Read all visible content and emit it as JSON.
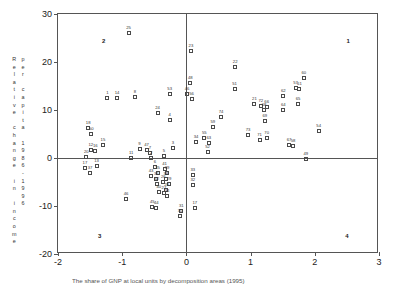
{
  "chart_data": {
    "type": "scatter",
    "title": "",
    "xlabel": "",
    "ylabel": "Relative change in income per capita 1986-1996",
    "ylabel_col1": "Relative change in income",
    "ylabel_col2": "per capita 1986-1996",
    "xlim": [
      -2,
      3
    ],
    "ylim": [
      -20,
      30
    ],
    "xticks": [
      -2,
      -1,
      0,
      1,
      2,
      3
    ],
    "xticklabels": [
      "-2",
      "-1",
      "0",
      "1",
      "2",
      "3"
    ],
    "yticks": [
      -20,
      -10,
      0,
      10,
      20,
      30
    ],
    "yticklabels": [
      "-20",
      "-10",
      "0",
      "10",
      "20",
      "30"
    ],
    "grid": false,
    "legend": null,
    "marker": "open-square",
    "quadrant_labels": [
      {
        "label": "1",
        "x": 2.52,
        "y": 24.4
      },
      {
        "label": "2",
        "x": -1.29,
        "y": 24.4
      },
      {
        "label": "3",
        "x": -1.35,
        "y": -16.2
      },
      {
        "label": "4",
        "x": 2.5,
        "y": -16.2
      }
    ],
    "points": [
      {
        "label": "25",
        "x": -0.9,
        "y": 26.1
      },
      {
        "label": "23",
        "x": 0.07,
        "y": 22.3
      },
      {
        "label": "22",
        "x": 0.76,
        "y": 18.9
      },
      {
        "label": "60",
        "x": 1.83,
        "y": 16.6
      },
      {
        "label": "48",
        "x": 0.06,
        "y": 15.6
      },
      {
        "label": "51",
        "x": 0.75,
        "y": 14.3
      },
      {
        "label": "57",
        "x": 1.7,
        "y": 14.6
      },
      {
        "label": "61",
        "x": 1.76,
        "y": 14.3
      },
      {
        "label": "53",
        "x": -0.26,
        "y": 13.4
      },
      {
        "label": "46",
        "x": 0.01,
        "y": 13.4
      },
      {
        "label": "62",
        "x": 1.51,
        "y": 12.9
      },
      {
        "label": "1",
        "x": -1.23,
        "y": 12.6
      },
      {
        "label": "14",
        "x": -1.08,
        "y": 12.6
      },
      {
        "label": "8",
        "x": -0.8,
        "y": 12.8
      },
      {
        "label": "56",
        "x": 0.08,
        "y": 12.2
      },
      {
        "label": "21",
        "x": 1.06,
        "y": 11.3
      },
      {
        "label": "72",
        "x": 1.16,
        "y": 10.9
      },
      {
        "label": "66",
        "x": 1.25,
        "y": 10.6
      },
      {
        "label": "68",
        "x": 1.21,
        "y": 9.9
      },
      {
        "label": "64",
        "x": 1.51,
        "y": 9.9
      },
      {
        "label": "65",
        "x": 1.74,
        "y": 11.3
      },
      {
        "label": "24",
        "x": -0.45,
        "y": 9.4
      },
      {
        "label": "74",
        "x": 0.54,
        "y": 8.6
      },
      {
        "label": "4",
        "x": -0.26,
        "y": 7.9
      },
      {
        "label": "69",
        "x": 1.22,
        "y": 7.8
      },
      {
        "label": "18",
        "x": -1.53,
        "y": 6.2
      },
      {
        "label": "59",
        "x": 0.41,
        "y": 6.4
      },
      {
        "label": "54",
        "x": 2.06,
        "y": 5.6
      },
      {
        "label": "50",
        "x": -1.48,
        "y": 5.1
      },
      {
        "label": "73",
        "x": 0.96,
        "y": 4.8
      },
      {
        "label": "70",
        "x": 1.25,
        "y": 4.2
      },
      {
        "label": "71",
        "x": 1.14,
        "y": 3.7
      },
      {
        "label": "55",
        "x": 0.28,
        "y": 4.1
      },
      {
        "label": "63",
        "x": 0.35,
        "y": 3.2
      },
      {
        "label": "34",
        "x": 0.15,
        "y": 3.3
      },
      {
        "label": "15",
        "x": -1.3,
        "y": 2.8
      },
      {
        "label": "3",
        "x": -0.21,
        "y": 2.1
      },
      {
        "label": "9",
        "x": -0.73,
        "y": 1.9
      },
      {
        "label": "12",
        "x": -1.49,
        "y": 1.7
      },
      {
        "label": "47",
        "x": -0.62,
        "y": 1.6
      },
      {
        "label": "16",
        "x": -1.42,
        "y": 1.5
      },
      {
        "label": "67",
        "x": 1.6,
        "y": 2.8
      },
      {
        "label": "58",
        "x": 1.66,
        "y": 2.6
      },
      {
        "label": "52",
        "x": 0.33,
        "y": 1.2
      },
      {
        "label": "7",
        "x": -0.57,
        "y": 1.0
      },
      {
        "label": "5",
        "x": -0.35,
        "y": 0.5
      },
      {
        "label": "2",
        "x": -0.55,
        "y": 0.1
      },
      {
        "label": "11",
        "x": -0.86,
        "y": 0.0
      },
      {
        "label": "20",
        "x": -1.56,
        "y": 0.2
      },
      {
        "label": "49",
        "x": 1.86,
        "y": -0.3
      },
      {
        "label": "13",
        "x": -1.4,
        "y": -1.6
      },
      {
        "label": "17",
        "x": -1.58,
        "y": -2.1
      },
      {
        "label": "6",
        "x": -0.49,
        "y": -1.9
      },
      {
        "label": "41",
        "x": -0.34,
        "y": -2.3
      },
      {
        "label": "39",
        "x": -0.3,
        "y": -3.1
      },
      {
        "label": "37",
        "x": -1.5,
        "y": -3.2
      },
      {
        "label": "35",
        "x": -0.45,
        "y": -3.2
      },
      {
        "label": "43",
        "x": -0.55,
        "y": -3.8
      },
      {
        "label": "36",
        "x": -0.47,
        "y": -4.3
      },
      {
        "label": "38",
        "x": -0.32,
        "y": -4.3
      },
      {
        "label": "33",
        "x": 0.1,
        "y": -3.5
      },
      {
        "label": "26",
        "x": -0.36,
        "y": -5.0
      },
      {
        "label": "29",
        "x": -0.27,
        "y": -5.4
      },
      {
        "label": "42",
        "x": -0.46,
        "y": -5.5
      },
      {
        "label": "32",
        "x": 0.1,
        "y": -5.6
      },
      {
        "label": "28",
        "x": -0.31,
        "y": -6.7
      },
      {
        "label": "40",
        "x": -0.43,
        "y": -7.0
      },
      {
        "label": "27",
        "x": -0.35,
        "y": -7.2
      },
      {
        "label": "34b",
        "x": -0.3,
        "y": -7.9
      },
      {
        "label": "46b",
        "x": -0.94,
        "y": -8.5
      },
      {
        "label": "45",
        "x": -0.53,
        "y": -10.3
      },
      {
        "label": "44",
        "x": -0.47,
        "y": -10.4
      },
      {
        "label": "31",
        "x": -0.08,
        "y": -11.0
      },
      {
        "label": "30",
        "x": -0.1,
        "y": -12.0
      },
      {
        "label": "17b",
        "x": 0.13,
        "y": -10.5
      }
    ]
  },
  "caption": {
    "text": "The share of GNP at local units by decomposition areas (1995)"
  }
}
